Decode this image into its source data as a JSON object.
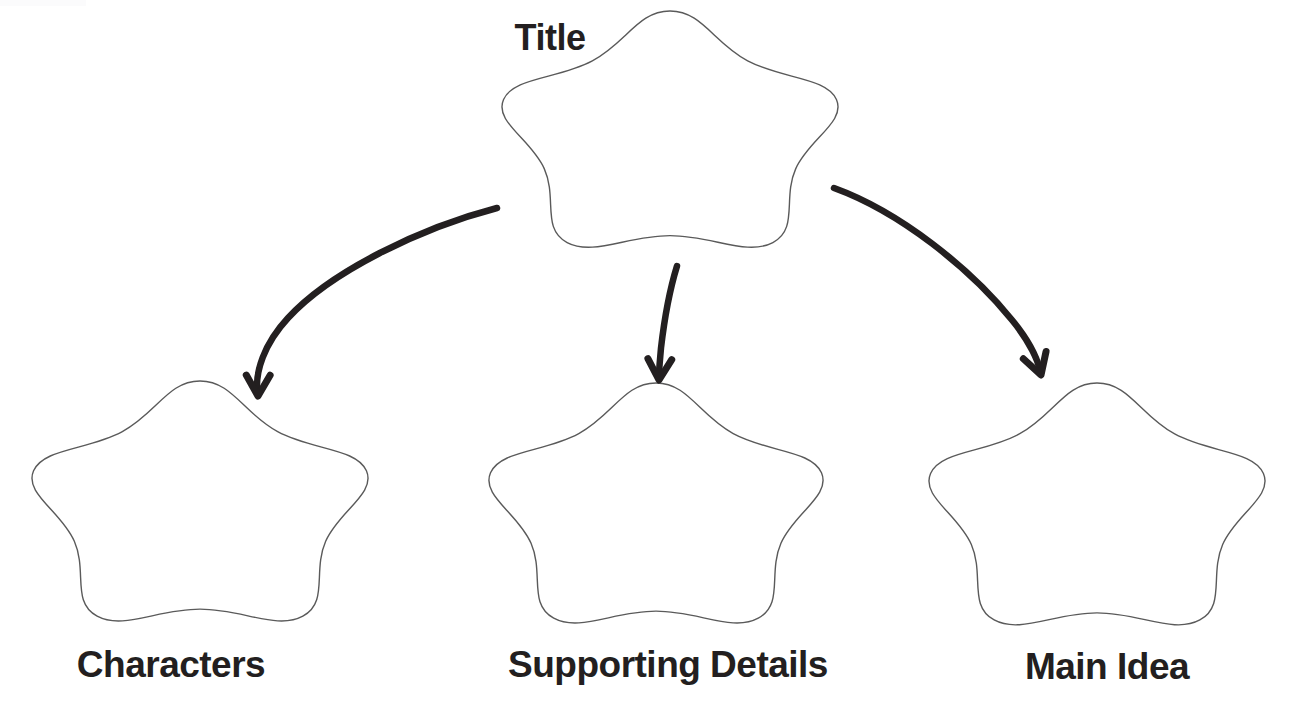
{
  "document": {
    "kind": "graphic-organizer",
    "shape": "five-lobed-flower",
    "background_color": "#ffffff",
    "outline_color": "#5a5a5a",
    "text_color": "#231f20",
    "arrow_color": "#231f20"
  },
  "nodes": {
    "title": {
      "label": "Title",
      "label_x": 550,
      "label_y": 20,
      "shape_cx": 670,
      "shape_cy": 139,
      "shape_rx": 175,
      "shape_ry": 128
    },
    "left": {
      "label": "Characters",
      "label_x": 171,
      "label_y": 646,
      "shape_cx": 200,
      "shape_cy": 511,
      "shape_rx": 175,
      "shape_ry": 130
    },
    "middle": {
      "label": "Supporting Details",
      "label_x": 668,
      "label_y": 646,
      "shape_cx": 656,
      "shape_cy": 513,
      "shape_rx": 174,
      "shape_ry": 130
    },
    "right": {
      "label": "Main Idea",
      "label_x": 1107,
      "label_y": 648,
      "shape_cx": 1097,
      "shape_cy": 514,
      "shape_rx": 175,
      "shape_ry": 131
    }
  },
  "connectors": [
    {
      "name": "title-to-characters",
      "from": "title",
      "to": "left",
      "path": "M 497 208 C 420 228 330 272 288 318 C 263 345 256 372 257 390",
      "head_tip_x": 258,
      "head_tip_y": 396
    },
    {
      "name": "title-to-supporting-details",
      "from": "title",
      "to": "middle",
      "path": "M 677 266 C 669 292 664 322 661 348 C 660 360 659 369 659 376",
      "head_tip_x": 659,
      "head_tip_y": 380
    },
    {
      "name": "title-to-main-idea",
      "from": "title",
      "to": "right",
      "path": "M 834 188 C 900 212 970 268 1012 320 C 1031 343 1038 362 1040 370",
      "head_tip_x": 1041,
      "head_tip_y": 375
    }
  ]
}
